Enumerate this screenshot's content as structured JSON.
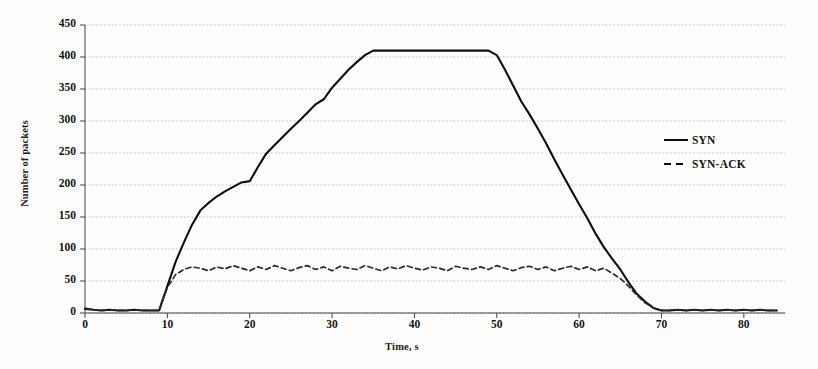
{
  "chart_data": {
    "type": "line",
    "title": "",
    "xlabel": "Time, s",
    "ylabel": "Number of packets",
    "xlim": [
      0,
      85
    ],
    "ylim": [
      0,
      450
    ],
    "xticks": [
      0,
      10,
      20,
      30,
      40,
      50,
      60,
      70,
      80
    ],
    "yticks": [
      0,
      50,
      100,
      150,
      200,
      250,
      300,
      350,
      400,
      450
    ],
    "grid": true,
    "legend_position": "right",
    "series": [
      {
        "name": "SYN",
        "style": "solid",
        "color": "#0d0d0d",
        "x": [
          0,
          1,
          2,
          3,
          4,
          5,
          6,
          7,
          8,
          9,
          10,
          11,
          12,
          13,
          14,
          15,
          16,
          17,
          18,
          19,
          20,
          21,
          22,
          23,
          24,
          25,
          26,
          27,
          28,
          29,
          30,
          31,
          32,
          33,
          34,
          35,
          36,
          37,
          38,
          39,
          40,
          41,
          42,
          43,
          44,
          45,
          46,
          47,
          48,
          49,
          50,
          51,
          52,
          53,
          54,
          55,
          56,
          57,
          58,
          59,
          60,
          61,
          62,
          63,
          64,
          65,
          66,
          67,
          68,
          69,
          70,
          71,
          72,
          73,
          74,
          75,
          76,
          77,
          78,
          79,
          80,
          81,
          82,
          83,
          84
        ],
        "values": [
          7,
          5,
          4,
          5,
          4,
          4,
          5,
          4,
          4,
          4,
          42,
          80,
          110,
          138,
          160,
          172,
          182,
          190,
          197,
          204,
          206,
          228,
          249,
          262,
          275,
          288,
          300,
          313,
          326,
          334,
          352,
          366,
          380,
          392,
          403,
          410,
          410,
          410,
          410,
          410,
          410,
          410,
          410,
          410,
          410,
          410,
          410,
          410,
          410,
          410,
          403,
          380,
          355,
          330,
          310,
          288,
          265,
          240,
          216,
          193,
          170,
          148,
          124,
          103,
          85,
          68,
          48,
          30,
          18,
          8,
          4,
          4,
          5,
          4,
          5,
          4,
          5,
          4,
          5,
          4,
          5,
          4,
          5,
          4,
          4
        ]
      },
      {
        "name": "SYN-ACK",
        "style": "dashed",
        "color": "#2a2a2a",
        "x": [
          0,
          1,
          2,
          3,
          4,
          5,
          6,
          7,
          8,
          9,
          10,
          11,
          12,
          13,
          14,
          15,
          16,
          17,
          18,
          19,
          20,
          21,
          22,
          23,
          24,
          25,
          26,
          27,
          28,
          29,
          30,
          31,
          32,
          33,
          34,
          35,
          36,
          37,
          38,
          39,
          40,
          41,
          42,
          43,
          44,
          45,
          46,
          47,
          48,
          49,
          50,
          51,
          52,
          53,
          54,
          55,
          56,
          57,
          58,
          59,
          60,
          61,
          62,
          63,
          64,
          65,
          66,
          67,
          68,
          69,
          70,
          71,
          72,
          73,
          74,
          75,
          76,
          77,
          78,
          79,
          80,
          81,
          82,
          83,
          84
        ],
        "values": [
          6,
          5,
          4,
          5,
          4,
          4,
          5,
          4,
          4,
          4,
          40,
          60,
          68,
          72,
          70,
          66,
          72,
          69,
          74,
          70,
          66,
          72,
          68,
          74,
          70,
          66,
          71,
          74,
          68,
          72,
          66,
          73,
          70,
          68,
          74,
          70,
          66,
          72,
          69,
          74,
          70,
          67,
          72,
          70,
          66,
          73,
          70,
          68,
          72,
          68,
          74,
          70,
          66,
          71,
          73,
          68,
          72,
          66,
          70,
          73,
          68,
          72,
          66,
          70,
          62,
          54,
          42,
          28,
          16,
          8,
          4,
          4,
          5,
          4,
          5,
          4,
          5,
          4,
          5,
          4,
          5,
          4,
          5,
          4,
          4
        ]
      }
    ],
    "axis_color": "#444444",
    "grid_color": "#b9b9b9"
  },
  "axes": {
    "y_title": "Number of packets",
    "x_title": "Time, s",
    "y_tick_labels": [
      "450",
      "400",
      "350",
      "300",
      "250",
      "200",
      "150",
      "100",
      "50",
      "0"
    ],
    "x_tick_labels": [
      "0",
      "10",
      "20",
      "30",
      "40",
      "50",
      "60",
      "70",
      "80"
    ]
  },
  "legend": {
    "items": [
      {
        "label": "SYN",
        "style": "solid"
      },
      {
        "label": "SYN-ACK",
        "style": "dashed"
      }
    ]
  }
}
